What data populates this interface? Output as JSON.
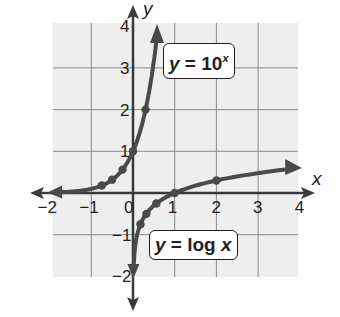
{
  "chart_data": {
    "type": "line",
    "title": "",
    "xlabel": "x",
    "ylabel": "y",
    "xlim": [
      -2.0,
      4.0
    ],
    "ylim": [
      -2.0,
      4.0
    ],
    "grid": true,
    "x_ticks": [
      -2,
      -1,
      0,
      1,
      2,
      3,
      4
    ],
    "y_ticks": [
      -2,
      -1,
      1,
      2,
      3,
      4
    ],
    "series": [
      {
        "name": "y = 10^x",
        "label_text": {
          "prefix": "y",
          "eq": " = 10",
          "sup": "x"
        },
        "points": [
          {
            "x": -2,
            "y": 0.01
          },
          {
            "x": -1,
            "y": 0.1
          },
          {
            "x": -0.75,
            "y": 0.18
          },
          {
            "x": -0.5,
            "y": 0.32
          },
          {
            "x": -0.25,
            "y": 0.56
          },
          {
            "x": 0,
            "y": 1
          },
          {
            "x": 0.301,
            "y": 2
          },
          {
            "x": 0.477,
            "y": 3
          },
          {
            "x": 0.6,
            "y": 3.98
          }
        ],
        "marked_points": [
          {
            "x": -0.75,
            "y": 0.18
          },
          {
            "x": -0.5,
            "y": 0.32
          },
          {
            "x": -0.25,
            "y": 0.56
          },
          {
            "x": 0,
            "y": 1
          },
          {
            "x": 0.301,
            "y": 2
          }
        ]
      },
      {
        "name": "y = log x",
        "label_text": {
          "prefix": "y",
          "eq": " = log ",
          "var": "x"
        },
        "points": [
          {
            "x": 0.01,
            "y": -2
          },
          {
            "x": 0.1,
            "y": -1
          },
          {
            "x": 0.18,
            "y": -0.75
          },
          {
            "x": 0.32,
            "y": -0.5
          },
          {
            "x": 0.56,
            "y": -0.25
          },
          {
            "x": 1,
            "y": 0
          },
          {
            "x": 2,
            "y": 0.301
          },
          {
            "x": 3,
            "y": 0.477
          },
          {
            "x": 4,
            "y": 0.6
          }
        ],
        "marked_points": [
          {
            "x": 0.18,
            "y": -0.75
          },
          {
            "x": 0.32,
            "y": -0.5
          },
          {
            "x": 0.56,
            "y": -0.25
          },
          {
            "x": 1,
            "y": 0
          },
          {
            "x": 2,
            "y": 0.301
          }
        ]
      }
    ],
    "annotations": [
      "y = 10^x",
      "y = log x"
    ]
  },
  "labels": {
    "exp_prefix": "y",
    "exp_eq": " = 10",
    "exp_sup": "x",
    "log_prefix": "y",
    "log_eq": " = log ",
    "log_var": "x",
    "x_axis_name": "x",
    "y_axis_name": "y"
  },
  "colors": {
    "grid_bg": "#eeeeee",
    "grid_line": "#8a8a8a",
    "axis": "#3a3a3a",
    "curve": "#4a4a4a",
    "text": "#231f20"
  }
}
